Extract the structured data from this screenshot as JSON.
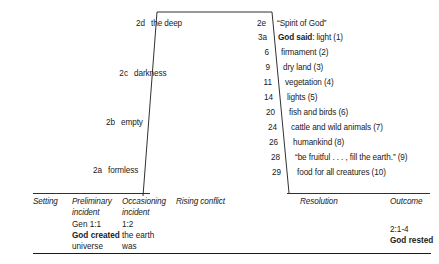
{
  "diagram": {
    "title_internal": "narrative-arc-genesis-1",
    "stroke_color": "#1a1a1a",
    "text_color": "#1a1a1a",
    "background": "#ffffff",
    "left_sequence": [
      {
        "ref": "2d",
        "label": "the deep"
      },
      {
        "ref": "2c",
        "label": "darkness"
      },
      {
        "ref": "2b",
        "label": "empty"
      },
      {
        "ref": "2a",
        "label": "formless"
      }
    ],
    "right_sequence": [
      {
        "ref": "2e",
        "label": "“Spirit of God”",
        "bold_prefix": ""
      },
      {
        "ref": "3a",
        "label": ": light (1)",
        "bold_prefix": "God said"
      },
      {
        "ref": "6",
        "label": "firmament (2)",
        "bold_prefix": ""
      },
      {
        "ref": "9",
        "label": "dry land (3)",
        "bold_prefix": ""
      },
      {
        "ref": "11",
        "label": "vegetation (4)",
        "bold_prefix": ""
      },
      {
        "ref": "14",
        "label": "lights (5)",
        "bold_prefix": ""
      },
      {
        "ref": "20",
        "label": "fish and birds (6)",
        "bold_prefix": ""
      },
      {
        "ref": "24",
        "label": "cattle and wild animals (7)",
        "bold_prefix": ""
      },
      {
        "ref": "26",
        "label": "humankind (8)",
        "bold_prefix": ""
      },
      {
        "ref": "28",
        "label": "“be fruitful . . . , fill the earth.” (9)",
        "bold_prefix": ""
      },
      {
        "ref": "29",
        "label": "food for all creatures (10)",
        "bold_prefix": ""
      }
    ],
    "columns": [
      {
        "header": "Setting",
        "lines": []
      },
      {
        "header": "Preliminary incident",
        "header_line1": "Preliminary",
        "header_line2": "incident",
        "lines": [
          {
            "text": "Gen 1:1",
            "bold": false
          },
          {
            "text": "God created",
            "bold": true
          },
          {
            "text": "universe",
            "bold": false
          }
        ]
      },
      {
        "header": "Occasioning incident",
        "header_line1": "Occasioning",
        "header_line2": "incident",
        "lines": [
          {
            "text": "1:2",
            "bold": false
          },
          {
            "text": "the earth",
            "bold": false
          },
          {
            "text": "was",
            "bold": false
          }
        ]
      },
      {
        "header": "Rising conflict",
        "header_line1": "Rising conflict",
        "header_line2": "",
        "lines": []
      },
      {
        "header": "Resolution",
        "header_line1": "Resolution",
        "header_line2": "",
        "lines": []
      },
      {
        "header": "Outcome",
        "header_line1": "Outcome",
        "header_line2": "",
        "lines": [
          {
            "text": "2:1-4",
            "bold": false
          },
          {
            "text": "God rested",
            "bold": true
          }
        ]
      }
    ]
  }
}
